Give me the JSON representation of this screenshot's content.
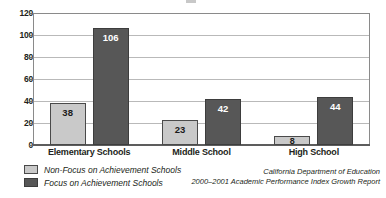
{
  "chart_data": {
    "type": "bar",
    "title": "",
    "xlabel": "",
    "ylabel": "",
    "ylim": [
      0,
      120
    ],
    "ytick_labels": [
      "120",
      "100",
      "80",
      "60",
      "40",
      "20",
      "0"
    ],
    "ytick_values": [
      120,
      100,
      80,
      60,
      40,
      20,
      0
    ],
    "grid": true,
    "legend_position": "bottom-left",
    "categories": [
      "Elementary Schools",
      "Middle School",
      "High School"
    ],
    "series": [
      {
        "name": "Non-Focus on Achievement Schools",
        "color": "#c9c9c9",
        "values": [
          38,
          23,
          8
        ],
        "labels": [
          "38",
          "23",
          "8"
        ]
      },
      {
        "name": "Focus on Achievement Schools",
        "color": "#575757",
        "values": [
          106,
          42,
          44
        ],
        "labels": [
          "106",
          "42",
          "44"
        ]
      }
    ]
  },
  "legend": {
    "items": [
      {
        "label": "Non-Focus on Achievement Schools",
        "swatch": "light-gray-swatch"
      },
      {
        "label": "Focus on Achievement Schools",
        "swatch": "dark-gray-swatch"
      }
    ]
  },
  "source_note": {
    "line1": "California Department of Education",
    "line2": "2000–2001 Academic Performance Index Growth Report"
  }
}
